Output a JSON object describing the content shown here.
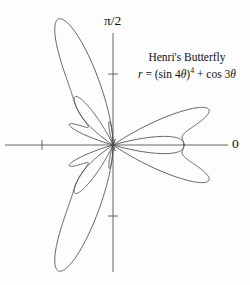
{
  "figure": {
    "background_color": "#fdfdfd",
    "curve_color": "#4c4c4c",
    "axis_color": "#555555"
  },
  "annotation": {
    "title": "Henri's Butterfly",
    "equation_plain": "r = (sin 4θ)⁴ + cos 3θ",
    "equation_lhs": "r",
    "equation_eq": " = (sin 4",
    "equation_theta1": "θ",
    "equation_close": ")",
    "equation_power": "4",
    "equation_mid": " + cos 3",
    "equation_theta2": "θ"
  },
  "axes": {
    "vertical_label": "π/2",
    "horizontal_label": "0",
    "origin": {
      "x": 113,
      "y": 145
    },
    "unit_px": 71,
    "x_axis_start_px": 5,
    "x_axis_end_px": 228,
    "y_axis_start_px": 33,
    "y_axis_end_px": 272,
    "tick_half_len_px": 5,
    "ticks": [
      {
        "name": "x-negative-one",
        "value": -1,
        "axis": "x"
      },
      {
        "name": "y-positive-one",
        "value": 1,
        "axis": "y"
      },
      {
        "name": "y-negative-one",
        "value": -1,
        "axis": "y"
      }
    ]
  },
  "chart_data": {
    "type": "line",
    "plot_kind": "polar",
    "title": "Henri's Butterfly",
    "equation": "r = (sin(4*theta))^4 + cos(3*theta)",
    "xlabel": "0",
    "ylabel": "π/2",
    "theta_range_deg": [
      0,
      360
    ],
    "theta_label_0": "0",
    "theta_label_90": "π/2",
    "samples": 2000,
    "grid": false,
    "legend": false,
    "r_tick_values": [
      1
    ],
    "axis_tick_labels": [],
    "r_max": 2.0,
    "notable_points": [
      {
        "theta_deg": 0,
        "r": 1.0,
        "note": "central right lobe tip"
      },
      {
        "theta_deg": 45,
        "r": 1.0,
        "note": "sin term maximum"
      },
      {
        "theta_deg": 60,
        "r": 0.5625,
        "note": ""
      },
      {
        "theta_deg": 90,
        "r": 0.0,
        "note": "curve passes through pole"
      },
      {
        "theta_deg": 135,
        "r": 1.0,
        "note": ""
      },
      {
        "theta_deg": 180,
        "r": -1.0,
        "note": "reflected lobe"
      },
      {
        "theta_deg": 225,
        "r": 1.0,
        "note": ""
      },
      {
        "theta_deg": 270,
        "r": 0.0,
        "note": ""
      },
      {
        "theta_deg": 315,
        "r": 1.0,
        "note": ""
      }
    ],
    "series": [
      {
        "name": "r = (sin 4θ)⁴ + cos 3θ",
        "color": "#4c4c4c",
        "linewidth": 0.9
      }
    ]
  }
}
